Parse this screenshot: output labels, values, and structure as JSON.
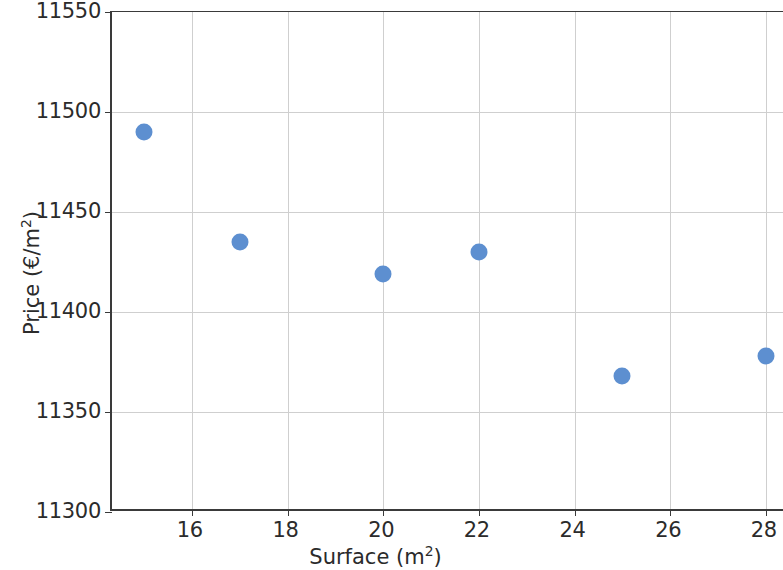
{
  "chart_data": {
    "type": "scatter",
    "title": "",
    "xlabel": "Surface (m²)",
    "ylabel": "Price (€/m²)",
    "xlabel_text": "Surface (m",
    "xlabel_sup": "2",
    "xlabel_tail": ")",
    "ylabel_text": "Price (€/m",
    "ylabel_sup": "2",
    "ylabel_tail": ")",
    "x": [
      15,
      17,
      20,
      22,
      25,
      28
    ],
    "y": [
      11490,
      11435,
      11419,
      11430,
      11368,
      11378
    ],
    "points": [
      {
        "x": 15,
        "y": 11490
      },
      {
        "x": 17,
        "y": 11435
      },
      {
        "x": 20,
        "y": 11419
      },
      {
        "x": 22,
        "y": 11430
      },
      {
        "x": 25,
        "y": 11368
      },
      {
        "x": 28,
        "y": 11378
      }
    ],
    "xlim": [
      14.33,
      28.4
    ],
    "ylim": [
      11300,
      11550
    ],
    "xticks": [
      16,
      18,
      20,
      22,
      24,
      26,
      28
    ],
    "yticks": [
      11300,
      11350,
      11400,
      11450,
      11500,
      11550
    ],
    "xticklabels": [
      "16",
      "18",
      "20",
      "22",
      "24",
      "26",
      "28"
    ],
    "yticklabels": [
      "11300",
      "11350",
      "11400",
      "11450",
      "11500",
      "11550"
    ],
    "grid": true,
    "grid_color": "#cfcfcf",
    "legend": null,
    "marker_color": "#5d8fd0",
    "marker_size": 17,
    "background_color": "#ffffff",
    "axis_color": "#3a3a3a"
  }
}
